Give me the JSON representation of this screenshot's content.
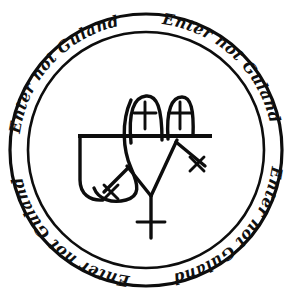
{
  "seal": {
    "title": "Seal of Guland",
    "inscription_phrase": "Enter not Guland",
    "background_color": "#ffffff",
    "ink_color": "#0d0d0d",
    "band": {
      "repetitions": 4,
      "segments": [
        {
          "text": "Enter not Guland",
          "start_angle": 200
        },
        {
          "text": "Enter not Guland",
          "start_angle": 290
        },
        {
          "text": "Enter not Guland",
          "start_angle": 20
        },
        {
          "text": "Enter not Guland",
          "start_angle": 110
        }
      ]
    },
    "circles": {
      "outer_radius": 136,
      "inner_radius": 118,
      "center_x": 146,
      "center_y": 150
    },
    "sigil": {
      "name": "guland-sigil",
      "horizontal_bar": {
        "x1": 78,
        "y1": 136,
        "x2": 212,
        "y2": 136
      },
      "arches": [
        {
          "name": "arch-left",
          "cross_label": "+"
        },
        {
          "name": "arch-right",
          "cross_label": "+"
        }
      ],
      "crosses": [
        {
          "name": "cross-upper-left",
          "style": "plus"
        },
        {
          "name": "cross-upper-right",
          "style": "plus"
        },
        {
          "name": "cross-left-arm",
          "style": "saltire"
        },
        {
          "name": "cross-right-arm",
          "style": "saltire"
        },
        {
          "name": "cross-bottom-stem",
          "style": "plus"
        }
      ],
      "stem": {
        "x": 150,
        "y_top": 196,
        "y_bottom": 238
      }
    }
  }
}
